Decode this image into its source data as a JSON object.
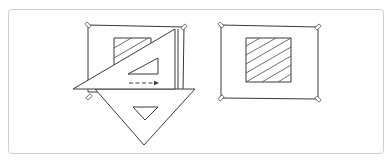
{
  "figure": {
    "colors": {
      "ink": "#3a3a3a",
      "frame_border": "#cfcfcf",
      "background": "#ffffff"
    },
    "panels": [
      {
        "id": "left",
        "elements": [
          "drawing-sheet",
          "corner-tapes",
          "hatched-square",
          "30-60-set-square",
          "45-set-square",
          "dashed-arrow"
        ]
      },
      {
        "id": "right",
        "elements": [
          "drawing-sheet",
          "corner-tapes",
          "hatched-square"
        ]
      }
    ]
  }
}
